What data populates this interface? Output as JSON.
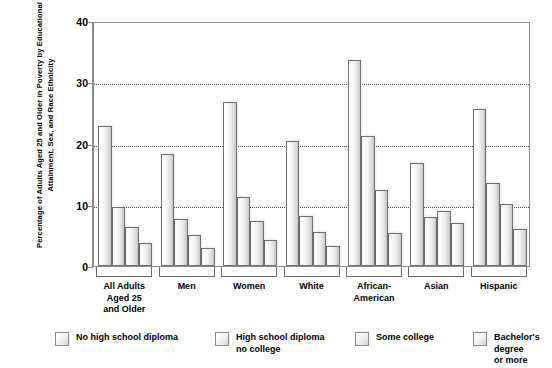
{
  "chart_data": {
    "type": "bar",
    "title": "",
    "subtitle": "",
    "xlabel": "",
    "ylabel": "Percentage of Adults Aged 25 and Older in Poverty by Educational Attainment, Sex, and Race Ethnicity",
    "ylim": [
      0,
      40
    ],
    "ytick_labels": [
      "0",
      "10",
      "20",
      "30",
      "40"
    ],
    "ytick_values": [
      0,
      10,
      20,
      30,
      40
    ],
    "grid": "horizontal-dotted-at-10-20-30",
    "legend_position": "bottom",
    "categories": [
      "All Adults\nAged 25\nand Older",
      "Men",
      "Women",
      "White",
      "African-\nAmerican",
      "Asian",
      "Hispanic"
    ],
    "series": [
      {
        "name": "No high school diploma",
        "values": [
          22.8,
          18.3,
          26.7,
          20.4,
          33.7,
          16.9,
          25.6
        ]
      },
      {
        "name": "High school diploma\nno college",
        "values": [
          9.7,
          7.6,
          11.2,
          8.2,
          21.2,
          8.0,
          13.6
        ]
      },
      {
        "name": "Some college",
        "values": [
          6.3,
          5.0,
          7.4,
          5.6,
          12.4,
          9.0,
          10.2
        ]
      },
      {
        "name": "Bachelor's degree\nor more",
        "values": [
          3.7,
          3.0,
          4.3,
          3.2,
          5.4,
          7.1,
          6.0
        ]
      }
    ],
    "colors": {
      "bar_fill_light": "#ffffff",
      "bar_fill_dark": "#c4c4c4",
      "bar_border": "#707070",
      "gridline": "#4a4a4a",
      "axis": "#8c8c8c",
      "text": "#000000",
      "background": "#ffffff"
    }
  }
}
